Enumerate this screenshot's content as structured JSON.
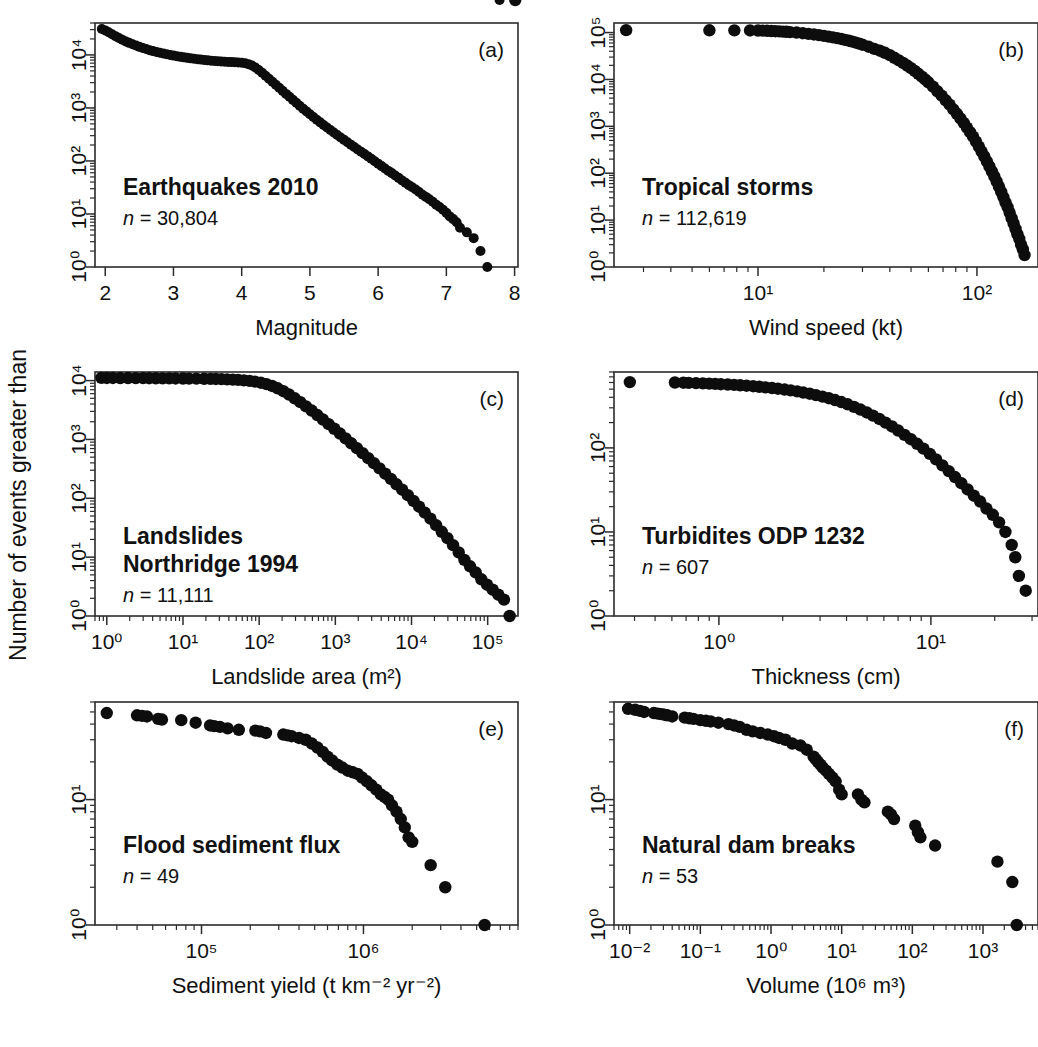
{
  "figure": {
    "shared_ylabel": "Number of events greater than",
    "background": "#ffffff",
    "marker_color": "#0d0d0d",
    "axis_color": "#2b2b2b",
    "panel_count": 6
  },
  "panels": [
    {
      "id": "(a)",
      "title": "Earthquakes 2010",
      "n_label": "n = 30,804",
      "n_value": 30804,
      "xlabel": "Magnitude",
      "x_scale": "linear",
      "y_scale": "log",
      "x_ticks": [
        "2",
        "3",
        "4",
        "5",
        "6",
        "7",
        "8"
      ],
      "y_ticks": [
        "10⁰",
        "10¹",
        "10²",
        "10³",
        "10⁴"
      ]
    },
    {
      "id": "(b)",
      "title": "Tropical storms",
      "n_label": "n = 112,619",
      "n_value": 112619,
      "xlabel": "Wind speed (kt)",
      "x_scale": "log",
      "y_scale": "log",
      "x_ticks": [
        "10¹",
        "10²"
      ],
      "y_ticks": [
        "10⁰",
        "10¹",
        "10²",
        "10³",
        "10⁴",
        "10⁵"
      ]
    },
    {
      "id": "(c)",
      "title_line1": "Landslides",
      "title_line2": "Northridge 1994",
      "n_label": "n = 11,111",
      "n_value": 11111,
      "xlabel": "Landslide area (m²)",
      "x_scale": "log",
      "y_scale": "log",
      "x_ticks": [
        "10⁰",
        "10¹",
        "10²",
        "10³",
        "10⁴",
        "10⁵"
      ],
      "y_ticks": [
        "10⁰",
        "10¹",
        "10²",
        "10³",
        "10⁴"
      ]
    },
    {
      "id": "(d)",
      "title": "Turbidites ODP 1232",
      "n_label": "n = 607",
      "n_value": 607,
      "xlabel": "Thickness (cm)",
      "x_scale": "log",
      "y_scale": "log",
      "x_ticks": [
        "10⁰",
        "10¹"
      ],
      "y_ticks": [
        "10⁰",
        "10¹",
        "10²"
      ]
    },
    {
      "id": "(e)",
      "title": "Flood sediment flux",
      "n_label": "n = 49",
      "n_value": 49,
      "xlabel": "Sediment yield (t km⁻² yr⁻²)",
      "x_scale": "log",
      "y_scale": "log",
      "x_ticks": [
        "10⁵",
        "10⁶"
      ],
      "y_ticks": [
        "10⁰",
        "10¹"
      ]
    },
    {
      "id": "(f)",
      "title": "Natural dam breaks",
      "n_label": "n = 53",
      "n_value": 53,
      "xlabel": "Volume (10⁶ m³)",
      "x_scale": "log",
      "y_scale": "log",
      "x_ticks": [
        "10⁻²",
        "10⁻¹",
        "10⁰",
        "10¹",
        "10²",
        "10³"
      ],
      "y_ticks": [
        "10⁰",
        "10¹"
      ]
    }
  ],
  "chart_data": [
    {
      "type": "scatter",
      "panel": "(a)",
      "title": "Earthquakes 2010",
      "xlabel": "Magnitude",
      "ylabel": "Number of events greater than",
      "annotation": "n = 30,804",
      "x_scale": "linear",
      "y_scale": "log",
      "xlim": [
        1.85,
        8.05
      ],
      "ylim": [
        1,
        40000
      ],
      "grid": false,
      "legend": "none",
      "x": [
        1.95,
        2.0,
        2.05,
        2.1,
        2.15,
        2.2,
        2.25,
        2.3,
        2.35,
        2.4,
        2.45,
        2.5,
        2.55,
        2.6,
        2.65,
        2.7,
        2.75,
        2.8,
        2.85,
        2.9,
        2.95,
        3.0,
        3.05,
        3.1,
        3.15,
        3.2,
        3.25,
        3.3,
        3.35,
        3.4,
        3.45,
        3.5,
        3.55,
        3.6,
        3.65,
        3.7,
        3.75,
        3.8,
        3.85,
        3.9,
        3.95,
        4.0,
        4.05,
        4.1,
        4.15,
        4.2,
        4.25,
        4.3,
        4.35,
        4.4,
        4.45,
        4.5,
        4.55,
        4.6,
        4.65,
        4.7,
        4.75,
        4.8,
        4.85,
        4.9,
        4.95,
        5.0,
        5.05,
        5.1,
        5.15,
        5.2,
        5.25,
        5.3,
        5.35,
        5.4,
        5.45,
        5.5,
        5.55,
        5.6,
        5.65,
        5.7,
        5.75,
        5.8,
        5.85,
        5.9,
        5.95,
        6.0,
        6.05,
        6.1,
        6.15,
        6.2,
        6.25,
        6.3,
        6.35,
        6.4,
        6.45,
        6.5,
        6.55,
        6.6,
        6.65,
        6.7,
        6.75,
        6.8,
        6.85,
        6.9,
        6.95,
        7.0,
        7.05,
        7.1,
        7.15,
        7.2,
        7.3,
        7.4,
        7.5,
        7.6,
        7.78
      ],
      "y": [
        30804,
        29000,
        26800,
        24500,
        22600,
        20800,
        19300,
        18000,
        16900,
        15900,
        15000,
        14200,
        13500,
        12900,
        12300,
        11800,
        11400,
        11000,
        10600,
        10300,
        10000,
        9700,
        9450,
        9200,
        9000,
        8800,
        8620,
        8460,
        8300,
        8160,
        8030,
        7900,
        7790,
        7690,
        7600,
        7520,
        7450,
        7380,
        7320,
        7270,
        7200,
        7100,
        6950,
        6700,
        6300,
        5800,
        5200,
        4600,
        4050,
        3560,
        3120,
        2730,
        2400,
        2100,
        1840,
        1620,
        1420,
        1250,
        1100,
        970,
        860,
        760,
        675,
        600,
        535,
        478,
        428,
        383,
        344,
        309,
        278,
        250,
        225,
        203,
        183,
        165,
        149,
        135,
        122,
        110,
        99,
        89,
        80,
        72,
        65,
        59,
        53,
        48,
        43,
        39,
        35,
        32,
        29,
        26,
        23,
        21,
        19,
        17,
        15,
        13.5,
        12,
        10.5,
        9,
        8,
        7,
        5.5,
        4.5,
        3.5,
        2,
        1
      ]
    },
    {
      "type": "scatter",
      "panel": "(b)",
      "title": "Tropical storms",
      "xlabel": "Wind speed (kt)",
      "ylabel": "Number of events greater than",
      "annotation": "n = 112,619",
      "x_scale": "log",
      "y_scale": "log",
      "xlim": [
        2.2,
        190
      ],
      "ylim": [
        1,
        160000
      ],
      "grid": false,
      "legend": "none",
      "x": [
        2.5,
        6.0,
        7.8,
        9.2,
        10,
        10.5,
        11,
        11.5,
        12,
        12.5,
        13,
        13.5,
        14,
        15,
        16,
        17,
        18,
        19,
        20,
        21,
        22,
        23,
        24,
        25,
        26,
        27,
        28,
        29,
        30,
        32,
        34,
        36,
        38,
        40,
        42,
        44,
        46,
        48,
        50,
        52,
        54,
        56,
        58,
        60,
        63,
        66,
        69,
        72,
        75,
        78,
        81,
        84,
        87,
        90,
        93,
        96,
        99,
        102,
        105,
        108,
        111,
        114,
        117,
        120,
        123,
        126,
        129,
        132,
        135,
        138,
        141,
        144,
        147,
        150,
        153,
        156,
        159,
        162,
        165
      ],
      "y": [
        112619,
        112000,
        111500,
        111000,
        110500,
        110000,
        109000,
        108000,
        107000,
        106000,
        105000,
        104000,
        102000,
        100000,
        97000,
        94000,
        91000,
        88000,
        85000,
        82000,
        79000,
        76000,
        73000,
        70000,
        67000,
        64000,
        61000,
        58000,
        55000,
        50000,
        45000,
        41000,
        37000,
        33000,
        29000,
        25500,
        22500,
        19800,
        17400,
        15200,
        13200,
        11500,
        10000,
        8700,
        7000,
        5600,
        4500,
        3600,
        2900,
        2300,
        1850,
        1480,
        1180,
        940,
        750,
        600,
        470,
        370,
        290,
        228,
        178,
        140,
        110,
        86,
        67,
        52,
        40,
        31,
        24,
        19,
        14.5,
        11,
        8.5,
        6.5,
        5,
        4,
        3,
        2.4,
        1.8,
        1
      ]
    },
    {
      "type": "scatter",
      "panel": "(c)",
      "title": "Landslides Northridge 1994",
      "xlabel": "Landslide area (m²)",
      "ylabel": "Number of events greater than",
      "annotation": "n = 11,111",
      "x_scale": "log",
      "y_scale": "log",
      "xlim": [
        0.7,
        250000
      ],
      "ylim": [
        1,
        14000
      ],
      "grid": false,
      "legend": "none",
      "x": [
        0.85,
        1.0,
        1.2,
        1.5,
        1.9,
        2.4,
        3.0,
        3.6,
        4.4,
        5.4,
        6.6,
        8.0,
        10,
        12,
        15,
        19,
        23,
        27,
        32,
        38,
        45,
        53,
        63,
        75,
        88,
        105,
        125,
        148,
        175,
        208,
        247,
        293,
        347,
        412,
        489,
        580,
        688,
        817,
        969,
        1150,
        1364,
        1618,
        1920,
        2278,
        2703,
        3207,
        3805,
        4515,
        5356,
        6355,
        7540,
        8946,
        10614,
        12593,
        14941,
        17726,
        21031,
        24953,
        29606,
        35128,
        41679,
        49452,
        58674,
        69614,
        82592,
        97990,
        116267,
        137953,
        163686,
        194212,
        230000
      ],
      "y": [
        11111,
        11100,
        11080,
        11060,
        11040,
        11020,
        11000,
        10980,
        10950,
        10920,
        10900,
        10880,
        10850,
        10820,
        10800,
        10750,
        10700,
        10650,
        10600,
        10500,
        10400,
        10300,
        10100,
        9900,
        9600,
        9200,
        8700,
        8100,
        7400,
        6600,
        5800,
        5000,
        4300,
        3650,
        3100,
        2600,
        2180,
        1820,
        1520,
        1260,
        1040,
        860,
        710,
        585,
        480,
        395,
        322,
        262,
        213,
        173,
        140,
        113,
        90,
        72,
        57,
        45,
        35,
        27,
        21,
        16,
        12,
        9,
        7,
        5.5,
        4.2,
        3.4,
        2.8,
        2.3,
        1.9,
        1
      ]
    },
    {
      "type": "scatter",
      "panel": "(d)",
      "title": "Turbidites ODP 1232",
      "xlabel": "Thickness (cm)",
      "ylabel": "Number of events greater than",
      "annotation": "n = 607",
      "x_scale": "log",
      "y_scale": "log",
      "xlim": [
        0.32,
        32
      ],
      "ylim": [
        1,
        800
      ],
      "grid": false,
      "legend": "none",
      "x": [
        0.38,
        0.62,
        0.68,
        0.72,
        0.78,
        0.84,
        0.9,
        0.96,
        1.02,
        1.1,
        1.18,
        1.26,
        1.35,
        1.45,
        1.55,
        1.66,
        1.78,
        1.9,
        2.04,
        2.18,
        2.34,
        2.5,
        2.68,
        2.87,
        3.08,
        3.3,
        3.53,
        3.78,
        4.05,
        4.34,
        4.65,
        4.98,
        5.33,
        5.71,
        6.11,
        6.55,
        7.01,
        7.51,
        8.04,
        8.61,
        9.22,
        9.88,
        10.58,
        11.33,
        12.13,
        12.99,
        13.91,
        14.9,
        15.95,
        17.08,
        18.29,
        19.59,
        20.97,
        22.46,
        24.05,
        25.0,
        26.0,
        28.0
      ],
      "y": [
        607,
        600,
        597,
        594,
        590,
        586,
        582,
        578,
        573,
        568,
        562,
        556,
        549,
        542,
        534,
        525,
        516,
        506,
        495,
        483,
        470,
        456,
        441,
        425,
        408,
        390,
        371,
        351,
        330,
        308,
        286,
        264,
        242,
        221,
        200,
        180,
        161,
        143,
        127,
        112,
        98,
        85,
        73,
        62,
        53,
        45,
        38,
        32,
        27,
        23,
        19,
        16,
        13,
        10,
        7,
        5,
        3,
        2
      ]
    },
    {
      "type": "scatter",
      "panel": "(e)",
      "title": "Flood sediment flux",
      "xlabel": "Sediment yield (t km⁻² yr⁻²)",
      "ylabel": "Number of events greater than",
      "annotation": "n = 49",
      "x_scale": "log",
      "y_scale": "log",
      "xlim": [
        22000,
        9000000
      ],
      "ylim": [
        1,
        60
      ],
      "grid": false,
      "legend": "none",
      "x": [
        26000,
        40000,
        43000,
        46000,
        54000,
        57000,
        75000,
        92000,
        113000,
        120000,
        130000,
        145000,
        170000,
        215000,
        230000,
        250000,
        320000,
        340000,
        360000,
        400000,
        440000,
        480000,
        520000,
        560000,
        600000,
        640000,
        690000,
        740000,
        800000,
        860000,
        920000,
        980000,
        1050000,
        1120000,
        1200000,
        1280000,
        1350000,
        1420000,
        1500000,
        1600000,
        1700000,
        1800000,
        1900000,
        2000000,
        2600000,
        3200000,
        5600000
      ],
      "y": [
        49,
        47,
        46.5,
        46,
        44,
        43.5,
        43,
        41,
        39,
        38.5,
        38,
        37,
        36,
        35.5,
        35,
        34,
        33,
        32.5,
        32,
        31,
        30,
        28,
        26,
        24,
        22,
        20.5,
        19,
        18,
        17,
        16.5,
        16,
        15,
        14,
        13,
        12,
        11,
        10.5,
        10,
        9,
        8,
        7,
        6,
        5,
        4.6,
        3,
        2,
        1
      ]
    },
    {
      "type": "scatter",
      "panel": "(f)",
      "title": "Natural dam breaks",
      "xlabel": "Volume (10⁶ m³)",
      "ylabel": "Number of events greater than",
      "annotation": "n = 53",
      "x_scale": "log",
      "y_scale": "log",
      "xlim": [
        0.006,
        6000
      ],
      "ylim": [
        1,
        60
      ],
      "grid": false,
      "legend": "none",
      "x": [
        0.0095,
        0.012,
        0.014,
        0.016,
        0.022,
        0.025,
        0.028,
        0.031,
        0.034,
        0.04,
        0.06,
        0.07,
        0.08,
        0.1,
        0.12,
        0.14,
        0.18,
        0.25,
        0.3,
        0.36,
        0.45,
        0.55,
        0.7,
        0.9,
        1.1,
        1.3,
        1.6,
        2.0,
        2.6,
        3.2,
        4.0,
        4.3,
        4.6,
        5.0,
        5.4,
        6.0,
        6.6,
        7.4,
        8.2,
        9.2,
        10,
        17,
        19,
        21,
        45,
        50,
        55,
        110,
        120,
        130,
        210,
        1600,
        2600,
        3000
      ],
      "y": [
        53,
        52,
        51,
        50,
        49,
        48.5,
        48,
        47.5,
        47,
        46,
        45,
        44.5,
        44,
        43,
        42.5,
        42,
        41,
        40,
        39,
        38,
        36,
        35,
        34,
        33,
        32,
        31,
        30,
        28,
        27,
        25,
        22,
        21,
        20,
        19,
        18,
        17,
        16,
        15,
        14,
        12,
        11,
        11,
        10,
        9.5,
        8,
        7.6,
        7,
        6.2,
        5.5,
        5,
        4.3,
        3.2,
        2.2,
        1
      ]
    }
  ]
}
